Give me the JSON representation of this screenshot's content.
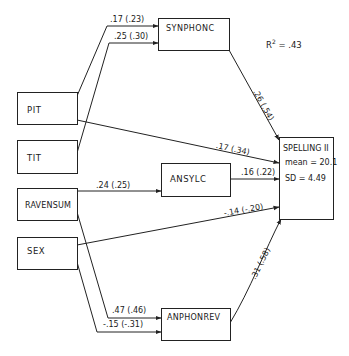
{
  "diagram": {
    "type": "path-diagram",
    "r_squared": {
      "label": "R",
      "exponent": "2",
      "value": "= .43"
    },
    "nodes": {
      "pit": "PIT",
      "tit": "TIT",
      "ravensum": "RAVENSUM",
      "sex": "SEX",
      "synphonc": "SYNPHONC",
      "ansylc": "ANSYLC",
      "anphonrev": "ANPHONREV",
      "spelling": {
        "title": "SPELLING II",
        "mean": "mean = 20.1",
        "sd": "SD = 4.49"
      }
    },
    "paths": [
      {
        "from": "PIT",
        "to": "SYNPHONC",
        "label": ".17 (.23)"
      },
      {
        "from": "TIT",
        "to": "SYNPHONC",
        "label": ".25 (.30)"
      },
      {
        "from": "SYNPHONC",
        "to": "SPELLING II",
        "label": ".26 (.54)"
      },
      {
        "from": "PIT",
        "to": "SPELLING II",
        "label": ".17 (.34)"
      },
      {
        "from": "RAVENSUM",
        "to": "ANSYLC",
        "label": ".24 (.25)"
      },
      {
        "from": "ANSYLC",
        "to": "SPELLING II",
        "label": ".16 (.22)"
      },
      {
        "from": "SEX",
        "to": "SPELLING II",
        "label": "-.14 (-.20)"
      },
      {
        "from": "RAVENSUM",
        "to": "ANPHONREV",
        "label": ".47 (.46)"
      },
      {
        "from": "SEX",
        "to": "ANPHONREV",
        "label": "-.15 (-.31)"
      },
      {
        "from": "ANPHONREV",
        "to": "SPELLING II",
        "label": ".31 (.58)"
      }
    ]
  }
}
